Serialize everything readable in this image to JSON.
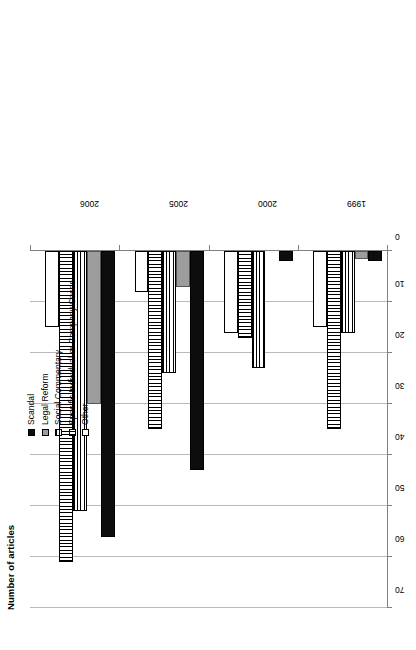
{
  "chart_data": {
    "type": "bar",
    "orientation": "horizontal",
    "title": "",
    "xlabel": "",
    "ylabel": "Number of articles",
    "ylim": [
      0,
      70
    ],
    "grid": true,
    "legend_position": "top-right",
    "tick_labels": [
      "70",
      "60",
      "50",
      "40",
      "30",
      "20",
      "10",
      "0"
    ],
    "tick_values": [
      70,
      60,
      50,
      40,
      30,
      20,
      10,
      0
    ],
    "categories": [
      "2006",
      "2005",
      "2000",
      "1999"
    ],
    "series": [
      {
        "name": "Scandal",
        "key": "scandal",
        "fill": "solid-black",
        "color": "#0d0d0d",
        "values": [
          56,
          43,
          2,
          2
        ]
      },
      {
        "name": "Legal Reform",
        "key": "legal",
        "fill": "solid-gray",
        "color": "#9d9d9d",
        "values": [
          30,
          7,
          0,
          1.5
        ]
      },
      {
        "name": "Social Commentary",
        "key": "social",
        "fill": "horizontal-stripes",
        "color": "#000000",
        "values": [
          51,
          24,
          23,
          16
        ]
      },
      {
        "name": "Specific Individual or Company Cases",
        "key": "specific",
        "fill": "vertical-stripes",
        "color": "#000000",
        "values": [
          61,
          35,
          17,
          35
        ]
      },
      {
        "name": "Other",
        "key": "other",
        "fill": "white",
        "color": "#ffffff",
        "values": [
          15,
          8,
          16,
          15
        ]
      }
    ]
  },
  "axis": {
    "y_title": "Number of articles"
  },
  "legend": {
    "items": [
      {
        "label": "Scandal"
      },
      {
        "label": "Legal Reform"
      },
      {
        "label": "Social Commentary"
      },
      {
        "label": "Specific Individual or Company Cases"
      },
      {
        "label": "Other"
      }
    ]
  }
}
